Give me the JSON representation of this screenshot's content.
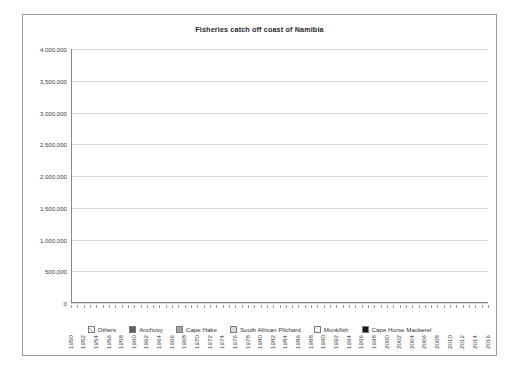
{
  "chart_data": {
    "type": "area",
    "stacked": true,
    "title": "Fisheries catch off coast of Namibia",
    "xlabel": "",
    "ylabel": "",
    "ylim": [
      0,
      4000000
    ],
    "ytick_labels": [
      "0",
      "500,000",
      "1,000,000",
      "1,500,000",
      "2,000,000",
      "2,500,000",
      "3,000,000",
      "3,500,000",
      "4,000,000"
    ],
    "ytick_values": [
      0,
      500000,
      1000000,
      1500000,
      2000000,
      2500000,
      3000000,
      3500000,
      4000000
    ],
    "grid": true,
    "legend_position": "bottom",
    "x_tick_step": 2,
    "x": [
      1950,
      1951,
      1952,
      1953,
      1954,
      1955,
      1956,
      1957,
      1958,
      1959,
      1960,
      1961,
      1962,
      1963,
      1964,
      1965,
      1966,
      1967,
      1968,
      1969,
      1970,
      1971,
      1972,
      1973,
      1974,
      1975,
      1976,
      1977,
      1978,
      1979,
      1980,
      1981,
      1982,
      1983,
      1984,
      1985,
      1986,
      1987,
      1988,
      1989,
      1990,
      1991,
      1992,
      1993,
      1994,
      1995,
      1996,
      1997,
      1998,
      1999,
      2000,
      2001,
      2002,
      2003,
      2004,
      2005,
      2006,
      2007,
      2008,
      2009,
      2010,
      2011,
      2012,
      2013,
      2014,
      2015,
      2016
    ],
    "xtick_labels": [
      "1950",
      "1952",
      "1954",
      "1956",
      "1958",
      "1960",
      "1962",
      "1964",
      "1966",
      "1968",
      "1970",
      "1972",
      "1974",
      "1976",
      "1978",
      "1980",
      "1982",
      "1984",
      "1986",
      "1988",
      "1990",
      "1992",
      "1994",
      "1996",
      "1998",
      "2000",
      "2002",
      "2004",
      "2006",
      "2008",
      "2010",
      "2012",
      "2014",
      "2016"
    ],
    "series": [
      {
        "name": "Others",
        "pattern": "cross-hatch",
        "values": [
          20000,
          22000,
          25000,
          27000,
          30000,
          32000,
          34000,
          36000,
          38000,
          40000,
          42000,
          45000,
          50000,
          60000,
          90000,
          140000,
          200000,
          260000,
          330000,
          380000,
          430000,
          500000,
          560000,
          620000,
          700000,
          780000,
          850000,
          930000,
          1000000,
          950000,
          900000,
          870000,
          840000,
          830000,
          800000,
          770000,
          740000,
          700000,
          640000,
          560000,
          470000,
          400000,
          360000,
          340000,
          330000,
          330000,
          330000,
          330000,
          330000,
          330000,
          330000,
          330000,
          330000,
          330000,
          330000,
          330000,
          320000,
          320000,
          320000,
          320000,
          320000,
          330000,
          340000,
          350000,
          330000,
          320000,
          300000
        ]
      },
      {
        "name": "Anchovy",
        "pattern": "dark-gray",
        "values": [
          0,
          0,
          0,
          0,
          0,
          0,
          0,
          0,
          0,
          0,
          0,
          0,
          0,
          0,
          0,
          0,
          10000,
          40000,
          90000,
          150000,
          220000,
          300000,
          380000,
          330000,
          260000,
          300000,
          380000,
          320000,
          260000,
          210000,
          170000,
          140000,
          120000,
          110000,
          100000,
          90000,
          80000,
          70000,
          60000,
          45000,
          30000,
          20000,
          15000,
          12000,
          10000,
          10000,
          10000,
          10000,
          10000,
          10000,
          10000,
          10000,
          10000,
          10000,
          10000,
          10000,
          10000,
          10000,
          10000,
          10000,
          10000,
          10000,
          10000,
          10000,
          10000,
          10000,
          10000
        ]
      },
      {
        "name": "Cape Hake",
        "pattern": "mid-gray",
        "values": [
          0,
          0,
          0,
          0,
          0,
          0,
          0,
          0,
          0,
          0,
          5000,
          10000,
          20000,
          40000,
          80000,
          130000,
          190000,
          250000,
          300000,
          330000,
          360000,
          400000,
          430000,
          400000,
          370000,
          400000,
          450000,
          420000,
          390000,
          360000,
          330000,
          310000,
          300000,
          290000,
          280000,
          270000,
          260000,
          240000,
          210000,
          180000,
          150000,
          130000,
          120000,
          115000,
          110000,
          110000,
          110000,
          110000,
          110000,
          110000,
          110000,
          110000,
          110000,
          110000,
          110000,
          110000,
          110000,
          110000,
          110000,
          110000,
          110000,
          120000,
          130000,
          150000,
          160000,
          170000,
          170000
        ]
      },
      {
        "name": "South African Pilchard",
        "pattern": "light-gray",
        "values": [
          250000,
          280000,
          300000,
          320000,
          340000,
          350000,
          360000,
          370000,
          380000,
          390000,
          400000,
          420000,
          480000,
          700000,
          1200000,
          1800000,
          2400000,
          2900000,
          2900000,
          2000000,
          1500000,
          1200000,
          1000000,
          700000,
          500000,
          600000,
          800000,
          700000,
          600000,
          500000,
          420000,
          380000,
          350000,
          330000,
          300000,
          280000,
          250000,
          220000,
          180000,
          140000,
          100000,
          70000,
          50000,
          40000,
          35000,
          35000,
          35000,
          35000,
          35000,
          35000,
          35000,
          35000,
          35000,
          35000,
          35000,
          35000,
          30000,
          30000,
          30000,
          30000,
          30000,
          30000,
          30000,
          30000,
          25000,
          25000,
          20000
        ]
      },
      {
        "name": "Monkfish",
        "pattern": "dotted",
        "values": [
          0,
          0,
          0,
          0,
          0,
          0,
          0,
          0,
          0,
          0,
          0,
          0,
          0,
          0,
          0,
          0,
          0,
          0,
          0,
          0,
          0,
          0,
          0,
          0,
          0,
          0,
          0,
          0,
          5000,
          6000,
          7000,
          8000,
          9000,
          10000,
          10000,
          10000,
          10000,
          10000,
          10000,
          9000,
          8000,
          7000,
          7000,
          7000,
          7000,
          7000,
          7000,
          7000,
          7000,
          7000,
          7000,
          7000,
          7000,
          7000,
          7000,
          7000,
          7000,
          7000,
          7000,
          7000,
          7000,
          8000,
          8000,
          9000,
          9000,
          9000,
          8000
        ]
      },
      {
        "name": "Cape Horse Mackerel",
        "pattern": "black",
        "values": [
          0,
          0,
          0,
          0,
          0,
          0,
          0,
          0,
          0,
          0,
          0,
          0,
          0,
          0,
          0,
          0,
          20000,
          60000,
          120000,
          200000,
          300000,
          420000,
          500000,
          420000,
          350000,
          420000,
          500000,
          430000,
          380000,
          900000,
          1000000,
          950000,
          1050000,
          1200000,
          1000000,
          900000,
          1000000,
          1100000,
          800000,
          500000,
          300000,
          180000,
          200000,
          300000,
          380000,
          330000,
          400000,
          350000,
          420000,
          380000,
          350000,
          340000,
          350000,
          330000,
          320000,
          300000,
          280000,
          250000,
          230000,
          200000,
          220000,
          280000,
          330000,
          400000,
          300000,
          220000,
          120000
        ]
      }
    ]
  },
  "legend": [
    {
      "label": "Others"
    },
    {
      "label": "Anchovy"
    },
    {
      "label": "Cape Hake"
    },
    {
      "label": "South African Pilchard"
    },
    {
      "label": "Monkfish"
    },
    {
      "label": "Cape Horse Mackerel"
    }
  ]
}
